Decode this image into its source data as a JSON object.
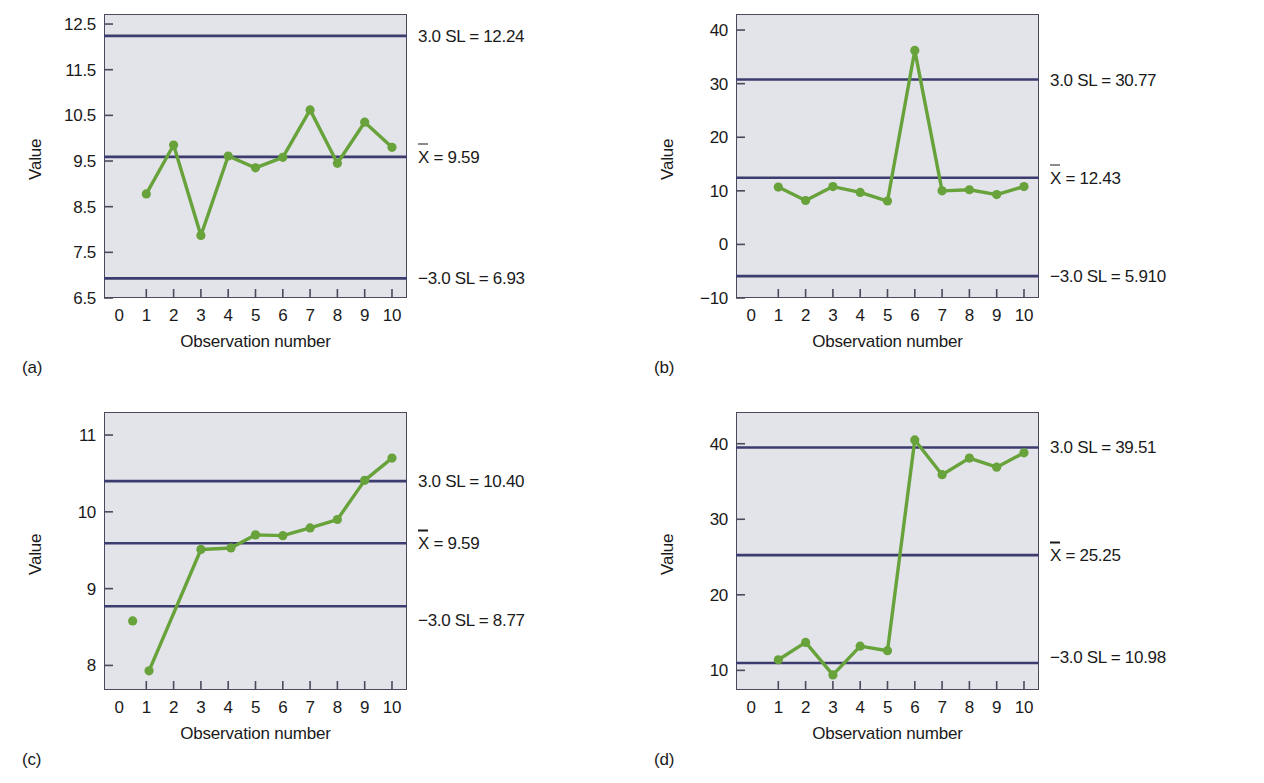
{
  "figure": {
    "axis_title_x": "Observation number",
    "axis_title_y": "Value",
    "xbar_symbol": "X",
    "panel_a_letter": "(a)",
    "panel_b_letter": "(b)",
    "panel_c_letter": "(c)",
    "panel_d_letter": "(d)",
    "colors": {
      "series_green": "#67a23a",
      "limit_navy": "#3c3c6e",
      "plot_background": "#e3e3ea",
      "frame": "#4a4a5c",
      "text": "#1a1a1a"
    }
  },
  "chart_data": [
    {
      "type": "line",
      "panel": "a",
      "title": "",
      "xlabel": "Observation number",
      "ylabel": "Value",
      "x": [
        1,
        2,
        3,
        4,
        5,
        6,
        7,
        8,
        9,
        10
      ],
      "values": [
        8.78,
        9.85,
        7.87,
        9.61,
        9.35,
        9.58,
        10.62,
        9.45,
        10.35,
        9.8
      ],
      "xlim": [
        -0.55,
        10.55
      ],
      "ylim": [
        6.5,
        12.72
      ],
      "xticks": [
        0,
        1,
        2,
        3,
        4,
        5,
        6,
        7,
        8,
        9,
        10
      ],
      "xticklabels": [
        "0",
        "1",
        "2",
        "3",
        "4",
        "5",
        "6",
        "7",
        "8",
        "9",
        "10"
      ],
      "yticks": [
        6.5,
        7.5,
        8.5,
        9.5,
        10.5,
        11.5,
        12.5
      ],
      "yticklabels": [
        "6.5",
        "7.5",
        "8.5",
        "9.5",
        "10.5",
        "11.5",
        "12.5"
      ],
      "grid": false,
      "limits": [
        {
          "name": "upper",
          "label": "3.0 SL = 12.24",
          "value": 12.24
        },
        {
          "name": "center",
          "label": " = 9.59",
          "value": 9.59,
          "has_xbar": true
        },
        {
          "name": "lower",
          "label": "−3.0 SL = 6.93",
          "value": 6.93
        }
      ]
    },
    {
      "type": "line",
      "panel": "b",
      "title": "",
      "xlabel": "Observation number",
      "ylabel": "Value",
      "x": [
        1,
        2,
        3,
        4,
        5,
        6,
        7,
        8,
        9,
        10
      ],
      "values": [
        10.7,
        8.2,
        10.8,
        9.7,
        8.1,
        36.2,
        10.0,
        10.2,
        9.3,
        10.8
      ],
      "xlim": [
        -0.55,
        10.55
      ],
      "ylim": [
        -10,
        43
      ],
      "xticks": [
        0,
        1,
        2,
        3,
        4,
        5,
        6,
        7,
        8,
        9,
        10
      ],
      "xticklabels": [
        "0",
        "1",
        "2",
        "3",
        "4",
        "5",
        "6",
        "7",
        "8",
        "9",
        "10"
      ],
      "yticks": [
        -10,
        0,
        10,
        20,
        30,
        40
      ],
      "yticklabels": [
        "−10",
        "0",
        "10",
        "20",
        "30",
        "40"
      ],
      "grid": false,
      "limits": [
        {
          "name": "upper",
          "label": "3.0 SL = 30.77",
          "value": 30.77
        },
        {
          "name": "center",
          "label": " = 12.43",
          "value": 12.43,
          "has_xbar": true
        },
        {
          "name": "lower",
          "label": "−3.0 SL = 5.910",
          "value": -5.91
        }
      ]
    },
    {
      "type": "line",
      "panel": "c",
      "title": "",
      "xlabel": "Observation number",
      "ylabel": "Value",
      "x": [
        1.1,
        3,
        4.1,
        5,
        6,
        7,
        8,
        9,
        10
      ],
      "values": [
        7.93,
        9.51,
        9.53,
        9.7,
        9.69,
        9.79,
        9.9,
        10.41,
        10.7
      ],
      "extra_points": [
        {
          "x": 0.5,
          "y": 8.58
        }
      ],
      "xlim": [
        -0.55,
        10.55
      ],
      "ylim": [
        7.68,
        11.3
      ],
      "xticks": [
        0,
        1,
        2,
        3,
        4,
        5,
        6,
        7,
        8,
        9,
        10
      ],
      "xticklabels": [
        "0",
        "1",
        "2",
        "3",
        "4",
        "5",
        "6",
        "7",
        "8",
        "9",
        "10"
      ],
      "yticks": [
        8,
        9,
        10,
        11
      ],
      "yticklabels": [
        "8",
        "9",
        "10",
        "11"
      ],
      "grid": false,
      "limits": [
        {
          "name": "upper",
          "label": "3.0 SL = 10.40",
          "value": 10.4
        },
        {
          "name": "center",
          "label": " = 9.59",
          "value": 9.59,
          "has_xbar": true
        },
        {
          "name": "lower",
          "label": "−3.0 SL = 8.77",
          "value": 8.77
        }
      ]
    },
    {
      "type": "line",
      "panel": "d",
      "title": "",
      "xlabel": "Observation number",
      "ylabel": "Value",
      "x": [
        1,
        2,
        3,
        4,
        5,
        6,
        7,
        8,
        9,
        10
      ],
      "values": [
        11.4,
        13.7,
        9.4,
        13.2,
        12.6,
        40.5,
        35.9,
        38.1,
        36.9,
        38.8
      ],
      "xlim": [
        -0.55,
        10.55
      ],
      "ylim": [
        7.4,
        44.2
      ],
      "xticks": [
        0,
        1,
        2,
        3,
        4,
        5,
        6,
        7,
        8,
        9,
        10
      ],
      "xticklabels": [
        "0",
        "1",
        "2",
        "3",
        "4",
        "5",
        "6",
        "7",
        "8",
        "9",
        "10"
      ],
      "yticks": [
        10,
        20,
        30,
        40
      ],
      "yticklabels": [
        "10",
        "20",
        "30",
        "40"
      ],
      "grid": false,
      "limits": [
        {
          "name": "upper",
          "label": "3.0 SL = 39.51",
          "value": 39.51
        },
        {
          "name": "center",
          "label": " = 25.25",
          "value": 25.25,
          "has_xbar": true
        },
        {
          "name": "lower",
          "label": "−3.0 SL = 10.98",
          "value": 10.98
        }
      ]
    }
  ]
}
